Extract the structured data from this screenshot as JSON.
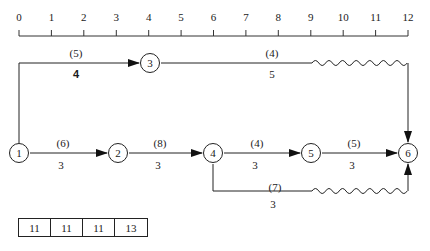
{
  "timescale": {
    "ticks": [
      "0",
      "1",
      "2",
      "3",
      "4",
      "5",
      "6",
      "7",
      "8",
      "9",
      "10",
      "11",
      "12"
    ]
  },
  "nodes": [
    {
      "id": "1",
      "label": "1"
    },
    {
      "id": "2",
      "label": "2"
    },
    {
      "id": "3",
      "label": "3"
    },
    {
      "id": "4",
      "label": "4"
    },
    {
      "id": "5",
      "label": "5"
    },
    {
      "id": "6",
      "label": "6"
    }
  ],
  "activities": [
    {
      "from": "1",
      "to": "3",
      "resource": "(5)",
      "duration": "4",
      "duration_bold": true
    },
    {
      "from": "3",
      "to": "6",
      "resource": "(4)",
      "duration": "5",
      "float": "wavy"
    },
    {
      "from": "1",
      "to": "2",
      "resource": "(6)",
      "duration": "3"
    },
    {
      "from": "2",
      "to": "4",
      "resource": "(8)",
      "duration": "3"
    },
    {
      "from": "4",
      "to": "5",
      "resource": "(4)",
      "duration": "3"
    },
    {
      "from": "5",
      "to": "6",
      "resource": "(5)",
      "duration": "3"
    },
    {
      "from": "4",
      "to": "6",
      "resource": "(7)",
      "duration": "3",
      "float": "wavy"
    }
  ],
  "resource_table": {
    "cells": [
      "11",
      "11",
      "11",
      "13"
    ]
  }
}
